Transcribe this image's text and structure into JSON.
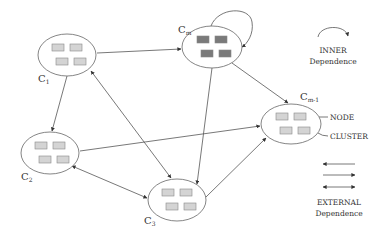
{
  "clusters": [
    {
      "id": "c1",
      "label": "C",
      "sub": "1",
      "cx": 67,
      "cy": 55,
      "rx": 29,
      "ry": 21,
      "node_color": "#d4d4d4",
      "lx": 38,
      "ly": 82
    },
    {
      "id": "cm",
      "label": "C",
      "sub": "m",
      "cx": 212,
      "cy": 47,
      "rx": 30,
      "ry": 21,
      "node_color": "#7a7a7a",
      "lx": 178,
      "ly": 33
    },
    {
      "id": "cm1",
      "label": "C",
      "sub": "m-1",
      "cx": 291,
      "cy": 124,
      "rx": 30,
      "ry": 20,
      "node_color": "#d4d4d4",
      "lx": 300,
      "ly": 100
    },
    {
      "id": "c2",
      "label": "C",
      "sub": "2",
      "cx": 50,
      "cy": 153,
      "rx": 29,
      "ry": 21,
      "node_color": "#d4d4d4",
      "lx": 21,
      "ly": 180
    },
    {
      "id": "c3",
      "label": "C",
      "sub": "3",
      "cx": 177,
      "cy": 200,
      "rx": 29,
      "ry": 21,
      "node_color": "#d4d4d4",
      "lx": 144,
      "ly": 224
    }
  ],
  "edges": [
    {
      "from": "c1",
      "to": "cm",
      "type": "directed"
    },
    {
      "from": "c1",
      "to": "c2",
      "type": "directed"
    },
    {
      "from": "c1",
      "to": "c3",
      "type": "bidirectional"
    },
    {
      "from": "cm",
      "to": "cm1",
      "type": "directed"
    },
    {
      "from": "cm",
      "to": "c3",
      "type": "directed"
    },
    {
      "from": "c2",
      "to": "cm1",
      "type": "directed"
    },
    {
      "from": "c2",
      "to": "c3",
      "type": "bidirectional"
    },
    {
      "from": "c3",
      "to": "cm1",
      "type": "directed"
    },
    {
      "from": "cm",
      "to": "cm",
      "type": "self-loop"
    }
  ],
  "callouts": {
    "node": "NODE",
    "cluster": "CLUSTER"
  },
  "legend": {
    "inner_title": "INNER",
    "inner_sub": "Dependence",
    "external_title": "EXTERNAL",
    "external_sub": "Dependence"
  },
  "colors": {
    "line": "#555555",
    "node_stroke": "#888888",
    "text": "#333333"
  }
}
